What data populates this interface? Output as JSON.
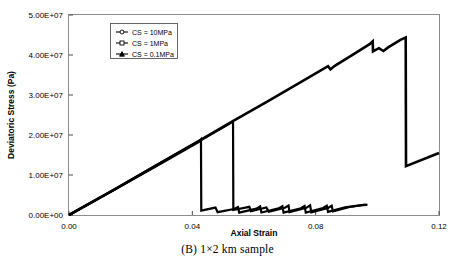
{
  "caption": "(B) 1×2 km sample",
  "chart_data": {
    "type": "line",
    "title": "",
    "xlabel": "Axial Strain",
    "ylabel": "Deviatoric Stress (Pa)",
    "xlim": [
      0,
      0.12
    ],
    "ylim": [
      0,
      50000000
    ],
    "xticks": [
      0,
      0.04,
      0.08,
      0.12
    ],
    "xticklabels": [
      "0.00",
      "0.04",
      "0.08",
      "0.12"
    ],
    "yticks": [
      0,
      10000000,
      20000000,
      30000000,
      40000000,
      50000000
    ],
    "yticklabels": [
      "0.00E+00",
      "1.00E+07",
      "2.00E+07",
      "3.00E+07",
      "4.00E+07",
      "5.00E+07"
    ],
    "grid": false,
    "legend_position": "upper-left",
    "series": [
      {
        "name": "CS = 10MPa",
        "marker": "open-circle-dash",
        "color": "#000000",
        "points": [
          [
            0.0,
            0
          ],
          [
            0.0145,
            6300000
          ],
          [
            0.029,
            12700000
          ],
          [
            0.043,
            18900000
          ],
          [
            0.053,
            23400000
          ],
          [
            0.064,
            28200000
          ],
          [
            0.076,
            33600000
          ],
          [
            0.084,
            37200000
          ],
          [
            0.0848,
            36400000
          ],
          [
            0.0862,
            37300000
          ],
          [
            0.09,
            39100000
          ],
          [
            0.0975,
            42700000
          ],
          [
            0.0985,
            43400000
          ],
          [
            0.0986,
            40900000
          ],
          [
            0.1005,
            41700000
          ],
          [
            0.102,
            41000000
          ],
          [
            0.1035,
            41900000
          ],
          [
            0.1075,
            43800000
          ],
          [
            0.1092,
            44400000
          ],
          [
            0.1093,
            12200000
          ],
          [
            0.12,
            15500000
          ]
        ]
      },
      {
        "name": "CS = 1MPa",
        "marker": "open-square",
        "color": "#000000",
        "points": [
          [
            0.0,
            0
          ],
          [
            0.015,
            6500000
          ],
          [
            0.03,
            13200000
          ],
          [
            0.043,
            18800000
          ],
          [
            0.052,
            22800000
          ],
          [
            0.0532,
            23400000
          ],
          [
            0.0533,
            1250000
          ],
          [
            0.0585,
            2050000
          ],
          [
            0.059,
            950000
          ],
          [
            0.064,
            1900000
          ],
          [
            0.0648,
            800000
          ],
          [
            0.07,
            1800000
          ],
          [
            0.0712,
            2350000
          ],
          [
            0.0715,
            700000
          ],
          [
            0.077,
            1800000
          ],
          [
            0.0782,
            2400000
          ],
          [
            0.0786,
            650000
          ],
          [
            0.084,
            1750000
          ],
          [
            0.0852,
            2300000
          ],
          [
            0.0856,
            900000
          ],
          [
            0.091,
            2000000
          ],
          [
            0.096,
            2600000
          ],
          [
            0.0968,
            2550000
          ]
        ]
      },
      {
        "name": "CS = 0.1MPa",
        "marker": "filled-triangle",
        "color": "#000000",
        "points": [
          [
            0.0,
            0
          ],
          [
            0.015,
            6400000
          ],
          [
            0.03,
            12900000
          ],
          [
            0.042,
            18200000
          ],
          [
            0.0428,
            18900000
          ],
          [
            0.0429,
            1100000
          ],
          [
            0.0475,
            1850000
          ],
          [
            0.0482,
            700000
          ],
          [
            0.0535,
            1500000
          ],
          [
            0.0548,
            2000000
          ],
          [
            0.0552,
            600000
          ],
          [
            0.0608,
            1600000
          ],
          [
            0.062,
            2150000
          ],
          [
            0.0624,
            620000
          ],
          [
            0.068,
            1650000
          ],
          [
            0.0692,
            2200000
          ],
          [
            0.0696,
            580000
          ],
          [
            0.0752,
            1700000
          ],
          [
            0.0764,
            2250000
          ],
          [
            0.0768,
            600000
          ],
          [
            0.0824,
            1750000
          ],
          [
            0.0836,
            2300000
          ],
          [
            0.084,
            800000
          ],
          [
            0.0895,
            1900000
          ],
          [
            0.095,
            2450000
          ],
          [
            0.0965,
            2500000
          ]
        ]
      }
    ],
    "vertical_drop_lines": [
      {
        "x": 0.0429,
        "y_top": 18900000,
        "y_bottom": 1100000
      },
      {
        "x": 0.0533,
        "y_top": 23400000,
        "y_bottom": 1250000
      },
      {
        "x": 0.1093,
        "y_top": 44400000,
        "y_bottom": 12200000
      },
      {
        "x": 0.0986,
        "y_top": 43400000,
        "y_bottom": 40900000
      }
    ]
  }
}
